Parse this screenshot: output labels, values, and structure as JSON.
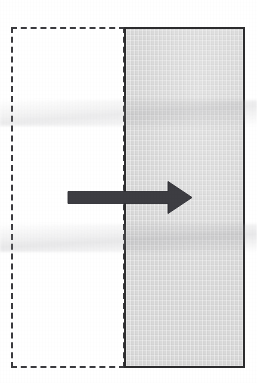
{
  "figure": {
    "title": "",
    "caption": "",
    "background_color": "#ffffff",
    "width": 257,
    "height": 383,
    "labels": [],
    "annotations": []
  },
  "shapes": {
    "dashed_rect": {
      "name": "dashed outline rectangle",
      "role": "original / undisplaced position",
      "stroke_color": "#3a3a3e",
      "stroke_style": "dashed",
      "stroke_width_px": 2.6,
      "fill": "none",
      "x": 11,
      "y": 27,
      "width": 114,
      "height": 341,
      "dash_length_px": 5,
      "dash_gap_px": 3.5,
      "label": ""
    },
    "solid_rect": {
      "name": "shaded solid rectangle",
      "role": "displaced / current position",
      "stroke_color": "#2c2c2e",
      "stroke_style": "solid",
      "stroke_width_px": 2.6,
      "fill_color": "#d9d9d9",
      "x": 124,
      "y": 27,
      "width": 121,
      "height": 341,
      "label": ""
    },
    "arrow": {
      "name": "displacement arrow",
      "direction": "right",
      "color": "#3d3d42",
      "tail_x": 68,
      "tip_x": 192,
      "center_y": 197,
      "shaft_thickness_px": 11,
      "head_length_px": 24,
      "head_width_px": 30,
      "label": ""
    }
  },
  "overlap": {
    "description": "dashed rectangle right edge coincides with solid rectangle left edge",
    "offset_px": 113
  }
}
